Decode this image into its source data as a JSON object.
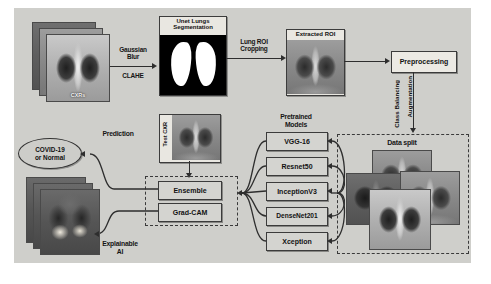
{
  "diagram": {
    "background_color": "#cfcfcb",
    "stages": {
      "input": {
        "label": "CXRs",
        "count": 3
      },
      "segmentation": {
        "label": "Unet Lungs Segmentation"
      },
      "roi": {
        "label": "Extracted ROI"
      },
      "preprocessing": {
        "label": "Preprocessing"
      },
      "data_split": {
        "label": "Data split",
        "count": 4
      },
      "test_cxr": {
        "label": "Test CXR"
      },
      "ensemble": {
        "label": "Ensemble"
      },
      "gradcam": {
        "label": "Grad-CAM"
      },
      "prediction_node": {
        "label": "COVID-19 or Normal",
        "line1": "COVID-19",
        "line2": "or Normal"
      },
      "explain_output": {
        "count": 3
      }
    },
    "edge_labels": {
      "gaussian_blur": "Gaussian Blur",
      "gaussian_blur_l1": "Gaussian",
      "gaussian_blur_l2": "Blur",
      "clahe": "CLAHE",
      "lung_roi_cropping": "Lung ROI Cropping",
      "lung_roi_l1": "Lung ROI",
      "lung_roi_l2": "Cropping",
      "augmentation": "Augmentation",
      "class_balancing": "Class Balancing",
      "prediction": "Prediction",
      "explainable_ai": "Explainable AI",
      "explainable_l1": "Explainable",
      "explainable_l2": "AI"
    },
    "models": {
      "heading_l1": "Pretrained",
      "heading_l2": "Models",
      "heading": "Pretrained Models",
      "items": [
        {
          "label": "VGG-16"
        },
        {
          "label": "Resnet50"
        },
        {
          "label": "InceptionV3"
        },
        {
          "label": "DenseNet201"
        },
        {
          "label": "Xception"
        }
      ]
    }
  }
}
